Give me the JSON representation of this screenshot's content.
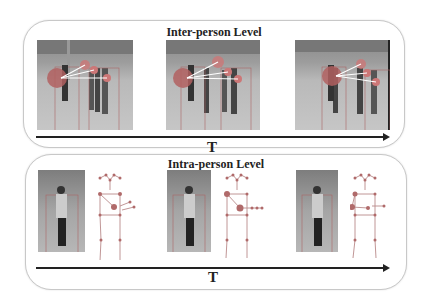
{
  "inter_panel": {
    "title": "Inter-person Level",
    "time_label": "T",
    "frames": [
      {
        "index": 1
      },
      {
        "index": 2
      },
      {
        "index": 3
      }
    ]
  },
  "intra_panel": {
    "title": "Intra-person Level",
    "time_label": "T",
    "frames": [
      {
        "index": 1
      },
      {
        "index": 2
      },
      {
        "index": 3
      }
    ]
  },
  "colors": {
    "highlight": "#b55a5a",
    "skeleton_line": "#b98a8a",
    "arrow": "#222222",
    "panel_border": "#c8c8c8"
  }
}
